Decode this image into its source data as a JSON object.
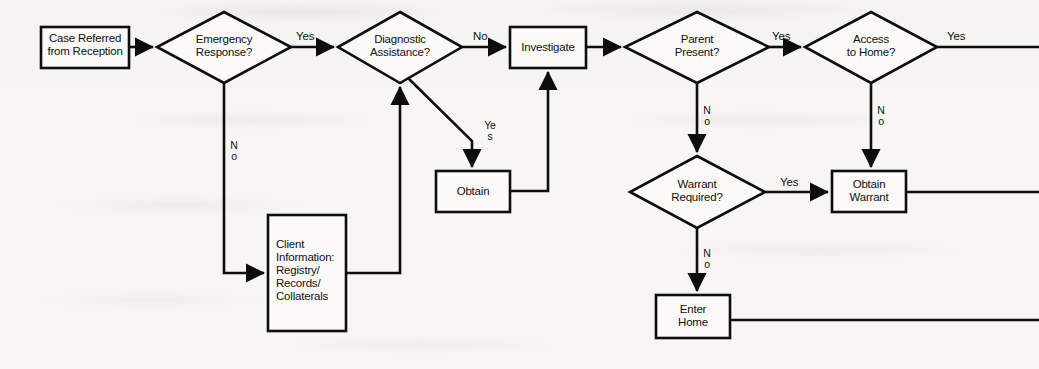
{
  "diagram": {
    "ink_color": "#0d0d0d",
    "paper_color": "#f7f6f4",
    "nodes": [
      {
        "id": "case-referred",
        "kind": "process",
        "label": "Case Referred\nfrom Reception"
      },
      {
        "id": "emergency-response",
        "kind": "decision",
        "label": "Emergency\nResponse?"
      },
      {
        "id": "diagnostic-assistance",
        "kind": "decision",
        "label": "Diagnostic\nAssistance?"
      },
      {
        "id": "investigate",
        "kind": "process",
        "label": "Investigate"
      },
      {
        "id": "parent-present",
        "kind": "decision",
        "label": "Parent\nPresent?"
      },
      {
        "id": "access-to-home",
        "kind": "decision",
        "label": "Access\nto Home?"
      },
      {
        "id": "obtain",
        "kind": "process",
        "label": "Obtain"
      },
      {
        "id": "client-information",
        "kind": "process",
        "label": "Client\nInformation:\nRegistry/\nRecords/\nCollaterals"
      },
      {
        "id": "warrant-required",
        "kind": "decision",
        "label": "Warrant\nRequired?"
      },
      {
        "id": "obtain-warrant",
        "kind": "process",
        "label": "Obtain\nWarrant"
      },
      {
        "id": "enter-home",
        "kind": "process",
        "label": "Enter\nHome"
      }
    ],
    "edge_labels": {
      "emergency_yes": "Yes",
      "emergency_no": "No",
      "diagnostic_no": "No",
      "diagnostic_yes": "Yes",
      "parent_yes": "Yes",
      "parent_no": "No",
      "access_yes": "Yes",
      "access_no": "No",
      "warrant_yes": "Yes",
      "warrant_no": "No"
    }
  }
}
